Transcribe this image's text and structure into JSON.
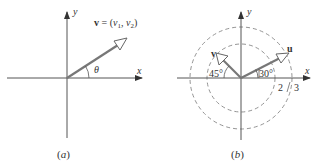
{
  "figure_a": {
    "caption": "(a)",
    "x_axis_label": "x",
    "y_axis_label": "y",
    "vector_label": "v = (v",
    "vector_label_parts": {
      "bold_v": "v",
      "eq": " = (",
      "v1": "v",
      "sub1": "1",
      "comma": ", ",
      "v2": "v",
      "sub2": "2",
      "close": ")"
    },
    "angle_label": "θ"
  },
  "figure_b": {
    "caption": "(b)",
    "x_axis_label": "x",
    "y_axis_label": "y",
    "vector_u_label": "u",
    "vector_v_label": "v",
    "angle_u_label": "30°",
    "angle_v_label": "45°",
    "circle_inner_label": "2",
    "circle_outer_label": "3"
  },
  "colors": {
    "axis": "#444444",
    "vector": "#666666",
    "circle": "#888888",
    "text": "#333333"
  }
}
